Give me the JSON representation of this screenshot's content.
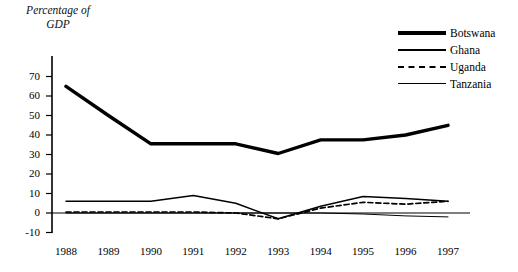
{
  "axis_title": {
    "line1": "Percentage of",
    "line2": "GDP"
  },
  "legend": {
    "items": [
      {
        "label": "Botswana",
        "style": "thick-solid"
      },
      {
        "label": "Ghana",
        "style": "medium-solid"
      },
      {
        "label": "Uganda",
        "style": "dashed"
      },
      {
        "label": "Tanzania",
        "style": "thin-solid"
      }
    ]
  },
  "chart_data": {
    "type": "line",
    "title": "",
    "xlabel": "",
    "ylabel": "Percentage of GDP",
    "x": [
      "1988",
      "1989",
      "1990",
      "1991",
      "1992",
      "1993",
      "1994",
      "1995",
      "1996",
      "1997"
    ],
    "categories": [
      "1988",
      "1989",
      "1990",
      "1991",
      "1992",
      "1993",
      "1994",
      "1995",
      "1996",
      "1997"
    ],
    "ylim": [
      -10,
      70
    ],
    "yticks": [
      -10,
      0,
      10,
      20,
      30,
      40,
      50,
      60,
      70
    ],
    "grid": false,
    "legend_position": "top-right",
    "series": [
      {
        "name": "Botswana",
        "style": "thick-solid",
        "color": "#000000",
        "values": [
          65,
          50,
          35.5,
          35.5,
          35.5,
          30.5,
          37.5,
          37.5,
          40,
          45
        ]
      },
      {
        "name": "Ghana",
        "style": "medium-solid",
        "color": "#000000",
        "values": [
          6,
          6,
          6,
          9,
          5,
          -3,
          3.5,
          8.5,
          7.5,
          6
        ]
      },
      {
        "name": "Uganda",
        "style": "dashed",
        "color": "#000000",
        "values": [
          0.5,
          0.5,
          0.5,
          0.5,
          0,
          -3,
          2.5,
          5.5,
          4.5,
          6
        ]
      },
      {
        "name": "Tanzania",
        "style": "thin-solid",
        "color": "#000000",
        "values": [
          0,
          0,
          0,
          0,
          0,
          0,
          0,
          -0.5,
          -1.5,
          -2
        ]
      }
    ]
  }
}
